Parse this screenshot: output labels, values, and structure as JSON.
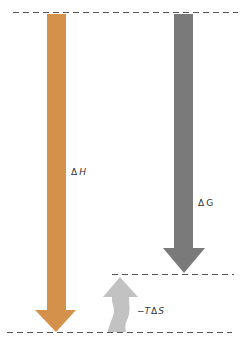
{
  "diagram": {
    "colors": {
      "enthalpy": "#D4914C",
      "free_energy": "#7A7A7A",
      "entropy": "#C2C2C2",
      "dashed_line": "#555555",
      "text": "#333333"
    },
    "labels": {
      "delta_h": {
        "delta": "Δ",
        "symbol": "H"
      },
      "delta_g": {
        "delta": "Δ",
        "symbol": "G"
      },
      "minus_t_delta_s": {
        "prefix": "−",
        "t": "T",
        "delta": "Δ",
        "s": "S"
      }
    },
    "levels": [
      {
        "name": "top-level",
        "y": 12
      },
      {
        "name": "free-energy-level",
        "y": 274
      },
      {
        "name": "bottom-level",
        "y": 332
      }
    ],
    "arrows": [
      {
        "name": "delta-h-arrow",
        "direction": "down",
        "from_level": "top-level",
        "to_level": "bottom-level"
      },
      {
        "name": "delta-g-arrow",
        "direction": "down",
        "from_level": "top-level",
        "to_level": "free-energy-level"
      },
      {
        "name": "minus-t-delta-s-arrow",
        "direction": "up",
        "from_level": "bottom-level",
        "to_level": "free-energy-level"
      }
    ]
  }
}
